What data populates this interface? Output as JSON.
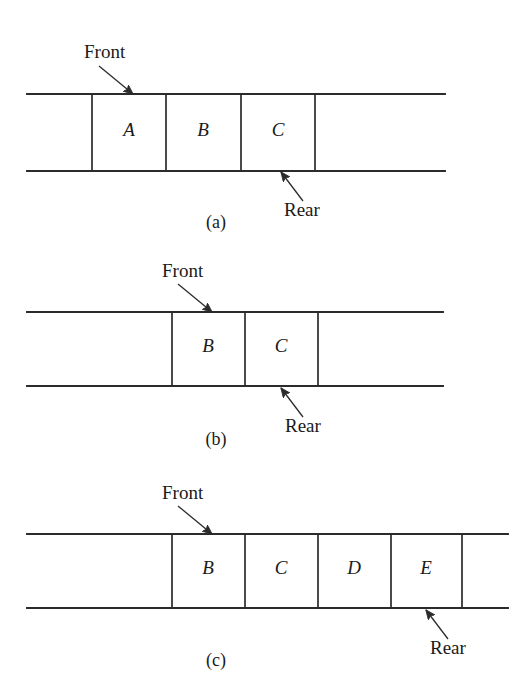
{
  "figure": {
    "background_color": "#ffffff",
    "ink_color": "#2b2b2b",
    "labels": {
      "front": "Front",
      "rear": "Rear"
    },
    "panels": [
      {
        "id": "a",
        "caption": "(a)",
        "caption_x": 216,
        "caption_y": 228,
        "rail_left": 27,
        "rail_right": 445,
        "rail_top_y": 94,
        "rail_bottom_y": 171,
        "dividers": [
          92,
          166,
          241,
          315
        ],
        "cells": [
          {
            "letter": "A",
            "cx": 129,
            "cy": 132
          },
          {
            "letter": "B",
            "cx": 203,
            "cy": 132
          },
          {
            "letter": "C",
            "cx": 278,
            "cy": 132
          }
        ],
        "front": {
          "text_x": 84,
          "text_y": 58,
          "line_x1": 99,
          "line_y1": 66,
          "line_x2": 133,
          "line_y2": 94
        },
        "rear": {
          "text_x": 284,
          "text_y": 216,
          "line_x1": 303,
          "line_y1": 201,
          "line_x2": 281,
          "line_y2": 172
        }
      },
      {
        "id": "b",
        "caption": "(b)",
        "caption_x": 216,
        "caption_y": 445,
        "rail_left": 27,
        "rail_right": 443,
        "rail_top_y": 312,
        "rail_bottom_y": 386,
        "dividers": [
          172,
          245,
          318
        ],
        "cells": [
          {
            "letter": "B",
            "cx": 208,
            "cy": 348
          },
          {
            "letter": "C",
            "cx": 281,
            "cy": 348
          }
        ],
        "front": {
          "text_x": 162,
          "text_y": 277,
          "line_x1": 178,
          "line_y1": 284,
          "line_x2": 212,
          "line_y2": 312
        },
        "rear": {
          "text_x": 285,
          "text_y": 432,
          "line_x1": 303,
          "line_y1": 417,
          "line_x2": 281,
          "line_y2": 388
        }
      },
      {
        "id": "c",
        "caption": "(c)",
        "caption_x": 216,
        "caption_y": 666,
        "rail_left": 27,
        "rail_right": 508,
        "rail_top_y": 534,
        "rail_bottom_y": 608,
        "dividers": [
          172,
          245,
          318,
          391,
          462
        ],
        "cells": [
          {
            "letter": "B",
            "cx": 208,
            "cy": 570
          },
          {
            "letter": "C",
            "cx": 281,
            "cy": 570
          },
          {
            "letter": "D",
            "cx": 354,
            "cy": 570
          },
          {
            "letter": "E",
            "cx": 426,
            "cy": 570
          }
        ],
        "front": {
          "text_x": 162,
          "text_y": 499,
          "line_x1": 178,
          "line_y1": 506,
          "line_x2": 212,
          "line_y2": 534
        },
        "rear": {
          "text_x": 430,
          "text_y": 654,
          "line_x1": 448,
          "line_y1": 639,
          "line_x2": 426,
          "line_y2": 610
        }
      }
    ]
  }
}
